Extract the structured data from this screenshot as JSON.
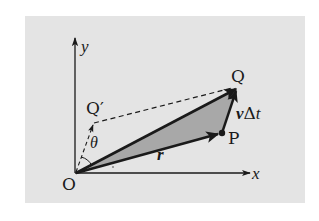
{
  "figure": {
    "background_color": "#e4e4e4",
    "shade_color": "#a8a8a8",
    "ink_color": "#1a1a1a",
    "points": {
      "origin": {
        "label": "O"
      },
      "P": {
        "label": "P"
      },
      "Q": {
        "label": "Q"
      },
      "Q_prime": {
        "label": "Q′"
      }
    },
    "axes": {
      "x_label": "x",
      "y_label": "y"
    },
    "vectors": {
      "r": {
        "label": "r",
        "from": "O",
        "to": "P"
      },
      "OQ": {
        "label": "",
        "from": "O",
        "to": "Q"
      },
      "v_dt": {
        "label_v": "v",
        "label_delta": "Δ",
        "label_t": "t",
        "from": "P",
        "to": "Q"
      },
      "OQ_prime": {
        "label": "",
        "from": "O",
        "to": "Q′",
        "style": "dashed"
      }
    },
    "dashed_line": {
      "from": "Q′",
      "to": "Q"
    },
    "angle": {
      "label": "θ",
      "between": [
        "x-axis",
        "OQ′"
      ]
    },
    "shaded_triangle": [
      "O",
      "P",
      "Q"
    ]
  }
}
